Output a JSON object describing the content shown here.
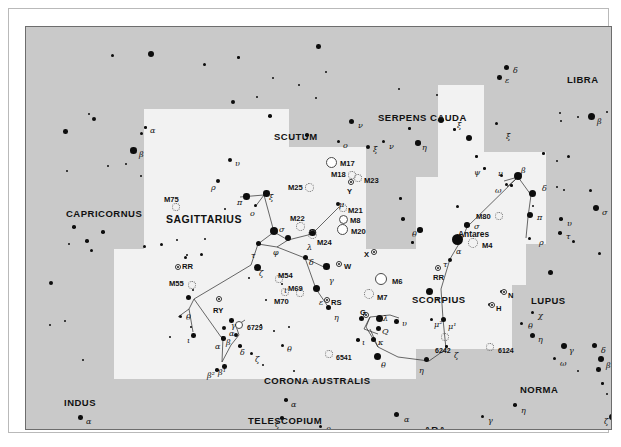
{
  "chart": {
    "type": "scatter",
    "background_sky": "#c9c9c9",
    "milky_way_fill": "#f2f2f2",
    "star_color": "#0d0d0d"
  },
  "constellations": [
    {
      "name": "CAPRICORNUS",
      "x": 40,
      "y": 182,
      "size": "mid"
    },
    {
      "name": "SCUTUM",
      "x": 248,
      "y": 105,
      "size": "mid"
    },
    {
      "name": "SERPENS CAUDA",
      "x": 352,
      "y": 86,
      "size": "mid"
    },
    {
      "name": "LIBRA",
      "x": 541,
      "y": 48,
      "size": "mid"
    },
    {
      "name": "SAGITTARIUS",
      "x": 140,
      "y": 187,
      "size": "big"
    },
    {
      "name": "SCORPIUS",
      "x": 386,
      "y": 268,
      "size": "mid"
    },
    {
      "name": "LUPUS",
      "x": 505,
      "y": 269,
      "size": "mid"
    },
    {
      "name": "INDUS",
      "x": 38,
      "y": 371,
      "size": "mid"
    },
    {
      "name": "CORONA AUSTRALIS",
      "x": 238,
      "y": 349,
      "size": "mid"
    },
    {
      "name": "TELESCOPIUM",
      "x": 222,
      "y": 389,
      "size": "mid"
    },
    {
      "name": "ARA",
      "x": 398,
      "y": 398,
      "size": "mid"
    },
    {
      "name": "NORMA",
      "x": 494,
      "y": 358,
      "size": "mid"
    }
  ],
  "named_stars": [
    {
      "label": "Antares",
      "x": 432,
      "y": 203
    }
  ],
  "deep_sky": [
    {
      "id": "M75",
      "kind": "globular",
      "x": 150,
      "y": 180,
      "r": 4,
      "label_x": 138,
      "label_y": 169
    },
    {
      "id": "M55",
      "kind": "globular",
      "x": 166,
      "y": 258,
      "r": 4,
      "label_x": 143,
      "label_y": 253
    },
    {
      "id": "M54",
      "kind": "globular",
      "x": 253,
      "y": 252,
      "r": 4,
      "label_x": 252,
      "label_y": 245
    },
    {
      "id": "M69",
      "kind": "globular",
      "x": 274,
      "y": 266,
      "r": 4,
      "label_x": 262,
      "label_y": 258
    },
    {
      "id": "M70",
      "kind": "globular",
      "x": 259,
      "y": 265,
      "r": 4,
      "label_x": 248,
      "label_y": 271
    },
    {
      "id": "M22",
      "kind": "globular",
      "x": 274,
      "y": 199,
      "r": 4.5,
      "label_x": 264,
      "label_y": 188
    },
    {
      "id": "M25",
      "kind": "globular",
      "x": 283,
      "y": 160,
      "r": 4.5,
      "label_x": 262,
      "label_y": 157
    },
    {
      "id": "M23",
      "kind": "globular",
      "x": 332,
      "y": 151,
      "r": 4,
      "label_x": 338,
      "label_y": 150
    },
    {
      "id": "M18",
      "kind": "globular",
      "x": 326,
      "y": 148,
      "r": 4,
      "label_x": 305,
      "label_y": 144
    },
    {
      "id": "M24",
      "kind": "globular",
      "x": 286,
      "y": 207,
      "r": 4.5,
      "label_x": 291,
      "label_y": 212
    },
    {
      "id": "M21",
      "kind": "globular",
      "x": 317,
      "y": 181,
      "r": 4,
      "label_x": 322,
      "label_y": 180
    },
    {
      "id": "M17",
      "kind": "open",
      "x": 305,
      "y": 135,
      "r": 5.5,
      "label_x": 314,
      "label_y": 133
    },
    {
      "id": "M8",
      "kind": "open",
      "x": 317,
      "y": 192,
      "r": 4.5,
      "label_x": 324,
      "label_y": 190
    },
    {
      "id": "M20",
      "kind": "open",
      "x": 316,
      "y": 202,
      "r": 5.5,
      "label_x": 325,
      "label_y": 201
    },
    {
      "id": "M6",
      "kind": "open",
      "x": 355,
      "y": 252,
      "r": 6,
      "label_x": 366,
      "label_y": 251
    },
    {
      "id": "M7",
      "kind": "globular",
      "x": 343,
      "y": 267,
      "r": 5,
      "label_x": 351,
      "label_y": 267
    },
    {
      "id": "M80",
      "kind": "globular",
      "x": 473,
      "y": 189,
      "r": 4,
      "label_x": 450,
      "label_y": 186
    },
    {
      "id": "M4",
      "kind": "globular",
      "x": 447,
      "y": 216,
      "r": 5,
      "label_x": 456,
      "label_y": 215
    },
    {
      "id": "6729",
      "kind": "open",
      "x": 213,
      "y": 298,
      "r": 4,
      "label_x": 221,
      "label_y": 297
    },
    {
      "id": "6541",
      "kind": "globular",
      "x": 303,
      "y": 327,
      "r": 4,
      "label_x": 310,
      "label_y": 327
    },
    {
      "id": "6242",
      "kind": "globular",
      "x": 419,
      "y": 310,
      "r": 4,
      "label_x": 409,
      "label_y": 320
    },
    {
      "id": "6124",
      "kind": "globular",
      "x": 464,
      "y": 320,
      "r": 4,
      "label_x": 472,
      "label_y": 320
    }
  ],
  "variable_stars": [
    {
      "id": "RR",
      "x": 152,
      "y": 240,
      "label_x": 156,
      "label_y": 236
    },
    {
      "id": "RR",
      "x": 412,
      "y": 241,
      "label_x": 407,
      "label_y": 247
    },
    {
      "id": "RY",
      "x": 193,
      "y": 272,
      "label_x": 187,
      "label_y": 280
    },
    {
      "id": "RS",
      "x": 301,
      "y": 273,
      "label_x": 305,
      "label_y": 272
    },
    {
      "id": "W",
      "x": 313,
      "y": 237,
      "label_x": 318,
      "label_y": 236
    },
    {
      "id": "X",
      "x": 348,
      "y": 225,
      "label_x": 338,
      "label_y": 224
    },
    {
      "id": "Y",
      "x": 325,
      "y": 155,
      "label_x": 321,
      "label_y": 161
    },
    {
      "id": "G",
      "x": 340,
      "y": 288,
      "label_x": 334,
      "label_y": 282
    },
    {
      "id": "N",
      "x": 478,
      "y": 265,
      "label_x": 482,
      "label_y": 265
    },
    {
      "id": "H",
      "x": 466,
      "y": 278,
      "label_x": 470,
      "label_y": 278
    }
  ],
  "greek_labels": [
    {
      "g": "α",
      "x": 124,
      "y": 100
    },
    {
      "g": "β",
      "x": 113,
      "y": 124
    },
    {
      "g": "υ",
      "x": 209,
      "y": 133
    },
    {
      "g": "ρ",
      "x": 185,
      "y": 157
    },
    {
      "g": "π",
      "x": 211,
      "y": 172
    },
    {
      "g": "ο",
      "x": 224,
      "y": 183
    },
    {
      "g": "ξ",
      "x": 243,
      "y": 167
    },
    {
      "g": "σ",
      "x": 253,
      "y": 199
    },
    {
      "g": "τ",
      "x": 225,
      "y": 225
    },
    {
      "g": "φ",
      "x": 247,
      "y": 222
    },
    {
      "g": "ζ",
      "x": 233,
      "y": 243
    },
    {
      "g": "μ",
      "x": 313,
      "y": 174
    },
    {
      "g": "λ",
      "x": 281,
      "y": 217
    },
    {
      "g": "δ",
      "x": 283,
      "y": 232
    },
    {
      "g": "γ",
      "x": 303,
      "y": 250
    },
    {
      "g": "ε",
      "x": 293,
      "y": 272
    },
    {
      "g": "η",
      "x": 308,
      "y": 287
    },
    {
      "g": "θ",
      "x": 160,
      "y": 287
    },
    {
      "g": "ι",
      "x": 161,
      "y": 310
    },
    {
      "g": "α",
      "x": 189,
      "y": 316
    },
    {
      "g": "β¹",
      "x": 192,
      "y": 342
    },
    {
      "g": "β²",
      "x": 181,
      "y": 345
    },
    {
      "g": "γ",
      "x": 205,
      "y": 295
    },
    {
      "g": "α",
      "x": 203,
      "y": 303
    },
    {
      "g": "β",
      "x": 200,
      "y": 312
    },
    {
      "g": "δ",
      "x": 214,
      "y": 322
    },
    {
      "g": "ζ",
      "x": 229,
      "y": 329
    },
    {
      "g": "θ",
      "x": 261,
      "y": 319
    },
    {
      "g": "ν",
      "x": 332,
      "y": 95
    },
    {
      "g": "ο",
      "x": 317,
      "y": 115
    },
    {
      "g": "ν",
      "x": 363,
      "y": 116
    },
    {
      "g": "ξ",
      "x": 347,
      "y": 119
    },
    {
      "g": "η",
      "x": 396,
      "y": 117
    },
    {
      "g": "ξ",
      "x": 431,
      "y": 95
    },
    {
      "g": "ξ",
      "x": 480,
      "y": 106
    },
    {
      "g": "ψ",
      "x": 448,
      "y": 142
    },
    {
      "g": "δ",
      "x": 487,
      "y": 40
    },
    {
      "g": "ε",
      "x": 479,
      "y": 50
    },
    {
      "g": "β",
      "x": 571,
      "y": 91
    },
    {
      "g": "θ",
      "x": 386,
      "y": 204
    },
    {
      "g": "ν",
      "x": 472,
      "y": 143
    },
    {
      "g": "β",
      "x": 495,
      "y": 140
    },
    {
      "g": "ω",
      "x": 469,
      "y": 160
    },
    {
      "g": "δ",
      "x": 516,
      "y": 158
    },
    {
      "g": "σ",
      "x": 448,
      "y": 196
    },
    {
      "g": "α",
      "x": 430,
      "y": 221
    },
    {
      "g": "τ",
      "x": 417,
      "y": 234
    },
    {
      "g": "π",
      "x": 511,
      "y": 187
    },
    {
      "g": "ρ",
      "x": 513,
      "y": 212
    },
    {
      "g": "υ",
      "x": 541,
      "y": 193
    },
    {
      "g": "τ",
      "x": 540,
      "y": 206
    },
    {
      "g": "σ",
      "x": 576,
      "y": 182
    },
    {
      "g": "χ",
      "x": 512,
      "y": 285
    },
    {
      "g": "θ",
      "x": 502,
      "y": 296
    },
    {
      "g": "η",
      "x": 512,
      "y": 309
    },
    {
      "g": "γ",
      "x": 543,
      "y": 320
    },
    {
      "g": "δ",
      "x": 575,
      "y": 320
    },
    {
      "g": "ω",
      "x": 534,
      "y": 333
    },
    {
      "g": "β",
      "x": 580,
      "y": 335
    },
    {
      "g": "ε",
      "x": 410,
      "y": 268
    },
    {
      "g": "μ¹",
      "x": 422,
      "y": 296
    },
    {
      "g": "μ²",
      "x": 408,
      "y": 294
    },
    {
      "g": "ζ",
      "x": 428,
      "y": 325
    },
    {
      "g": "η",
      "x": 393,
      "y": 340
    },
    {
      "g": "θ",
      "x": 355,
      "y": 335
    },
    {
      "g": "ι",
      "x": 336,
      "y": 312
    },
    {
      "g": "κ",
      "x": 352,
      "y": 312
    },
    {
      "g": "Q",
      "x": 356,
      "y": 301
    },
    {
      "g": "λ",
      "x": 357,
      "y": 288
    },
    {
      "g": "υ",
      "x": 376,
      "y": 293
    },
    {
      "g": "α",
      "x": 60,
      "y": 391
    },
    {
      "g": "α",
      "x": 265,
      "y": 374
    },
    {
      "g": "ζ",
      "x": 249,
      "y": 394
    },
    {
      "g": "θ",
      "x": 300,
      "y": 400
    },
    {
      "g": "α",
      "x": 378,
      "y": 389
    },
    {
      "g": "γ",
      "x": 462,
      "y": 390
    },
    {
      "g": "η",
      "x": 495,
      "y": 380
    },
    {
      "g": "ζ",
      "x": 578,
      "y": 391
    },
    {
      "g": "ι",
      "x": 258,
      "y": 260
    }
  ],
  "axes": {
    "xlabel": "",
    "ylabel": ""
  }
}
